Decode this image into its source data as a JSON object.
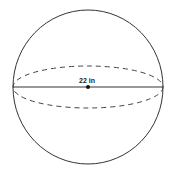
{
  "figure": {
    "shape": "sphere",
    "diameter_label": "22 in",
    "colors": {
      "stroke": "#333333",
      "background": "#ffffff"
    }
  }
}
